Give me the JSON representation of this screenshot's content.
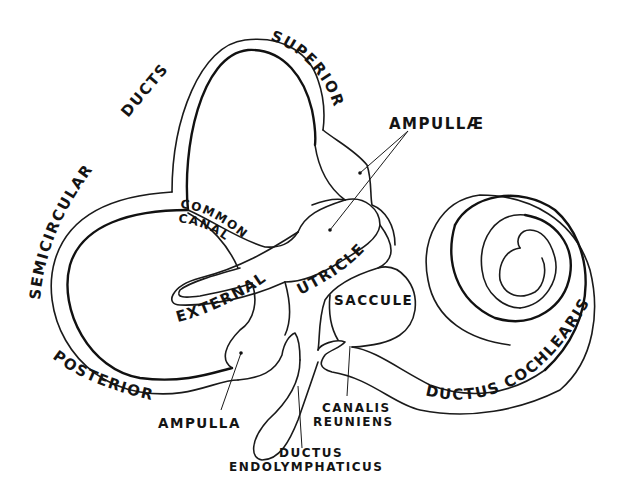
{
  "figure": {
    "background": "#ffffff",
    "line_color": "#1a1a1a"
  },
  "labels": {
    "semicircular": "SEMICIRCULAR",
    "ducts": "DUCTS",
    "superior": "SUPERIOR",
    "ampullae": "AMPULLÆ",
    "common": "COMMON",
    "canal": "CANAL",
    "external": "EXTERNAL",
    "utricle": "UTRICLE",
    "saccule": "SACCULE",
    "posterior": "POSTERIOR",
    "ampulla": "AMPULLA",
    "canalis": "CANALIS",
    "reuniens": "REUNIENS",
    "ductus": "DUCTUS",
    "endolymphaticus": "ENDOLYMPHATICUS",
    "ductus_cochlearis": "DUCTUS COCHLEARIS"
  }
}
